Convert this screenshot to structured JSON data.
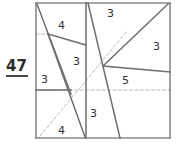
{
  "problem": {
    "number": "47"
  },
  "figure": {
    "frame": {
      "x": 36,
      "y": 3,
      "width": 134,
      "height": 135
    },
    "colors": {
      "solid_stroke": "#6e6e6e",
      "frame_stroke": "#8a8a8a",
      "dashed_stroke": "#b9b9b9",
      "label_text": "#2f2f2f",
      "background": "#ffffff"
    },
    "solid_lines": [
      {
        "name": "left-border",
        "x1": 36,
        "y1": 3,
        "x2": 36,
        "y2": 138
      },
      {
        "name": "top-border",
        "x1": 36,
        "y1": 3,
        "x2": 170,
        "y2": 3
      },
      {
        "name": "right-border",
        "x1": 170,
        "y1": 3,
        "x2": 170,
        "y2": 138
      },
      {
        "name": "bottom-border",
        "x1": 36,
        "y1": 138,
        "x2": 170,
        "y2": 138
      },
      {
        "name": "vertical-divider-left",
        "x1": 86,
        "y1": 3,
        "x2": 86,
        "y2": 138
      },
      {
        "name": "cevian-upper-left",
        "x1": 37,
        "y1": 4,
        "x2": 71,
        "y2": 94
      },
      {
        "name": "cevian-left-long",
        "x1": 48,
        "y1": 34,
        "x2": 85,
        "y2": 137
      },
      {
        "name": "chord-upper-left",
        "x1": 48,
        "y1": 34,
        "x2": 86,
        "y2": 45
      },
      {
        "name": "horizontal-left-mid",
        "x1": 36,
        "y1": 90,
        "x2": 71,
        "y2": 90
      },
      {
        "name": "cevian-right-steep",
        "x1": 88,
        "y1": 3,
        "x2": 120,
        "y2": 138
      },
      {
        "name": "diagonal-right-up",
        "x1": 103,
        "y1": 66,
        "x2": 168,
        "y2": 4
      },
      {
        "name": "chord-right-low",
        "x1": 103,
        "y1": 66,
        "x2": 170,
        "y2": 72
      }
    ],
    "dashed_lines": [
      {
        "name": "dashed-diagonal",
        "x1": 40,
        "y1": 136,
        "x2": 127,
        "y2": 31
      },
      {
        "name": "dashed-horizontal",
        "x1": 36,
        "y1": 90,
        "x2": 170,
        "y2": 90
      },
      {
        "name": "dashed-upper-short",
        "x1": 36,
        "y1": 34,
        "x2": 49,
        "y2": 34
      }
    ],
    "labels": [
      {
        "name": "label-4-top-left",
        "text": "4",
        "x": 58,
        "y": 20
      },
      {
        "name": "label-3-top-right",
        "text": "3",
        "x": 107,
        "y": 8
      },
      {
        "name": "label-3-right-edge",
        "text": "3",
        "x": 153,
        "y": 41
      },
      {
        "name": "label-3-left-mid",
        "text": "3",
        "x": 73,
        "y": 56
      },
      {
        "name": "label-3-left-small",
        "text": "3",
        "x": 41,
        "y": 74
      },
      {
        "name": "label-5-center",
        "text": "5",
        "x": 122,
        "y": 75
      },
      {
        "name": "label-3-lower-mid",
        "text": "3",
        "x": 90,
        "y": 108
      },
      {
        "name": "label-4-bottom",
        "text": "4",
        "x": 58,
        "y": 125
      }
    ]
  }
}
